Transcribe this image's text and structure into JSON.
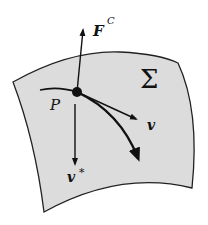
{
  "diagram": {
    "surface": {
      "label": "Σ",
      "fill": "#dcdcdc",
      "stroke": "#222222"
    },
    "point": {
      "label": "P"
    },
    "vectors": {
      "constraint_force": {
        "label": "F",
        "superscript": "C"
      },
      "velocity": {
        "label": "v"
      },
      "velocity_star": {
        "label": "v",
        "superscript": "*"
      }
    }
  }
}
